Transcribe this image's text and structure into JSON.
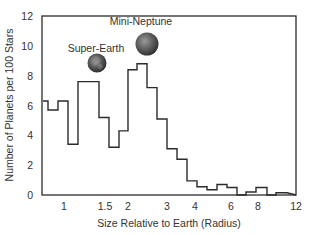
{
  "chart_data": {
    "type": "bar",
    "subtype": "step-histogram",
    "title": "",
    "xlabel": "Size Relative to Earth (Radius)",
    "ylabel": "Number of Planets per 100 Stars",
    "xscale": "log",
    "xlim": [
      0.68,
      12
    ],
    "ylim": [
      0,
      12
    ],
    "x_ticks": [
      "1",
      "1.5",
      "2",
      "3",
      "4",
      "6",
      "8",
      "12"
    ],
    "y_ticks": [
      "0",
      "2",
      "4",
      "6",
      "8",
      "10",
      "12"
    ],
    "grid": false,
    "legend": null,
    "bins": [
      {
        "x0": 0.68,
        "x1": 0.76,
        "value": 6.3
      },
      {
        "x0": 0.76,
        "x1": 0.87,
        "value": 5.7
      },
      {
        "x0": 0.87,
        "x1": 1.0,
        "value": 6.3
      },
      {
        "x0": 1.0,
        "x1": 1.14,
        "value": 3.4
      },
      {
        "x0": 1.14,
        "x1": 1.41,
        "value": 7.6
      },
      {
        "x0": 1.41,
        "x1": 1.6,
        "value": 5.2
      },
      {
        "x0": 1.6,
        "x1": 1.78,
        "value": 3.2
      },
      {
        "x0": 1.78,
        "x1": 2.0,
        "value": 4.3
      },
      {
        "x0": 2.0,
        "x1": 2.25,
        "value": 8.4
      },
      {
        "x0": 2.25,
        "x1": 2.52,
        "value": 8.8
      },
      {
        "x0": 2.52,
        "x1": 2.84,
        "value": 7.2
      },
      {
        "x0": 2.84,
        "x1": 3.2,
        "value": 5.1
      },
      {
        "x0": 3.2,
        "x1": 3.6,
        "value": 3.1
      },
      {
        "x0": 3.6,
        "x1": 4.05,
        "value": 2.4
      },
      {
        "x0": 4.05,
        "x1": 4.55,
        "value": 0.95
      },
      {
        "x0": 4.55,
        "x1": 5.1,
        "value": 0.55
      },
      {
        "x0": 5.1,
        "x1": 5.75,
        "value": 0.35
      },
      {
        "x0": 5.75,
        "x1": 6.45,
        "value": 0.7
      },
      {
        "x0": 6.45,
        "x1": 7.25,
        "value": 0.5
      },
      {
        "x0": 7.25,
        "x1": 8.1,
        "value": 0.0
      },
      {
        "x0": 8.1,
        "x1": 9.1,
        "value": 0.2
      },
      {
        "x0": 9.1,
        "x1": 10.3,
        "value": 0.5
      },
      {
        "x0": 10.3,
        "x1": 11.5,
        "value": 0.0
      },
      {
        "x0": 11.5,
        "x1": 12.0,
        "value": 0.15
      }
    ],
    "annotations": [
      {
        "text": "Super-Earth",
        "near_x": 1.3,
        "near_y": 7.6,
        "image": "super-earth-globe"
      },
      {
        "text": "Mini-Neptune",
        "near_x": 2.45,
        "near_y": 8.8,
        "image": "mini-neptune-globe"
      }
    ]
  },
  "layout_px": {
    "plot": {
      "left": 42,
      "right": 296,
      "top": 16,
      "bottom": 195
    },
    "bin_edges_px": [
      43,
      48,
      58,
      68,
      78,
      99,
      109,
      119,
      128,
      137,
      147,
      157,
      167,
      177,
      187,
      197,
      207,
      217,
      227,
      237,
      246,
      256,
      267,
      276,
      287,
      296
    ],
    "x_tick_px": [
      64,
      105,
      128,
      167,
      195,
      231,
      258,
      296
    ],
    "y_tick_values": [
      0,
      2,
      4,
      6,
      8,
      10,
      12
    ]
  },
  "labels": {
    "super_earth": "Super-Earth",
    "mini_neptune": "Mini-Neptune",
    "xlabel": "Size Relative to Earth (Radius)",
    "ylabel": "Number of Planets per 100 Stars"
  },
  "colors": {
    "line": "#2b2b2b",
    "text": "#333333",
    "globe_dark": "#3a3a3a",
    "globe_light": "#a8a8a8"
  }
}
